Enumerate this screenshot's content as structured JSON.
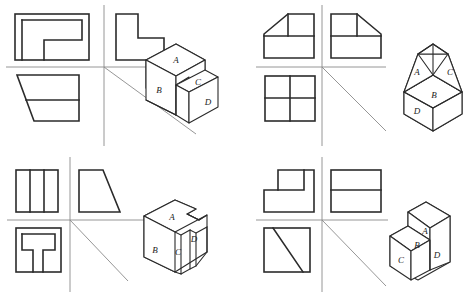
{
  "figure": {
    "kind": "engineering-drawing-worksheet",
    "panel_count": 4,
    "stroke_color": "#2b2b2b",
    "axis_color": "#8a8a8a",
    "background_color": "#ffffff"
  },
  "panels": [
    {
      "id": "panel-1",
      "position": "top-left",
      "views": [
        {
          "name": "top-view",
          "slot": "upper-left",
          "shape": "square-with-internal-L-partition",
          "outline": "square",
          "internal_lines": [
            "horizontal-mid-right",
            "vertical-mid-lower"
          ]
        },
        {
          "name": "front-view",
          "slot": "upper-right",
          "shape": "L-shaped-profile",
          "outline": "L-block"
        },
        {
          "name": "side-view",
          "slot": "lower-left",
          "shape": "trapezoid-with-horizontal-divider",
          "outline": "trapezoid",
          "internal_lines": [
            "horizontal-divider"
          ]
        }
      ],
      "axes": {
        "vertical": true,
        "horizontal": true,
        "diagonal_miter": true
      },
      "solid": {
        "name": "stepped-block",
        "description": "Two level stepped rectangular block seen in isometric",
        "labels": [
          "A",
          "B",
          "C",
          "D"
        ],
        "label_faces": {
          "A": "upper-top-face",
          "B": "front-left-vertical-face",
          "C": "lower-top-face",
          "D": "lower-right-vertical-face"
        }
      }
    },
    {
      "id": "panel-2",
      "position": "top-right",
      "views": [
        {
          "name": "top-view",
          "slot": "upper-left",
          "shape": "rectangle-with-left-chamfer",
          "outline": "rectangle-chamfered-top-left",
          "internal_lines": [
            "horizontal-mid",
            "vertical-upper"
          ]
        },
        {
          "name": "front-view",
          "slot": "upper-right",
          "shape": "rectangle-with-right-chamfer",
          "outline": "rectangle-chamfered-top-right",
          "internal_lines": [
            "horizontal-mid",
            "vertical-upper"
          ]
        },
        {
          "name": "side-view",
          "slot": "lower-left",
          "shape": "square-quartered",
          "outline": "square",
          "internal_lines": [
            "horizontal-mid",
            "vertical-mid"
          ]
        }
      ],
      "axes": {
        "vertical": true,
        "horizontal": true,
        "diagonal_miter": true
      },
      "solid": {
        "name": "hip-roof-on-base",
        "description": "Rectangular base block topped by a four sided hip roof",
        "labels": [
          "A",
          "B",
          "C",
          "D"
        ],
        "label_faces": {
          "A": "left-roof-slope",
          "B": "front-roof-slope",
          "C": "right-roof-slope",
          "D": "base-front-left-face"
        }
      }
    },
    {
      "id": "panel-3",
      "position": "bottom-left",
      "views": [
        {
          "name": "top-view",
          "slot": "upper-left",
          "shape": "square-with-two-vertical-dividers",
          "outline": "square",
          "internal_lines": [
            "vertical-third-1",
            "vertical-third-2"
          ]
        },
        {
          "name": "front-view",
          "slot": "upper-right",
          "shape": "right-trapezoid",
          "outline": "trapezoid-sloped-right"
        },
        {
          "name": "side-view",
          "slot": "lower-left",
          "shape": "square-with-inverted-T-notch",
          "outline": "square",
          "internal_lines": [
            "horizontal-mid",
            "vertical-left-leg",
            "vertical-right-leg"
          ]
        }
      ],
      "axes": {
        "vertical": true,
        "horizontal": true,
        "diagonal_miter": true
      },
      "solid": {
        "name": "grooved-wedge-block",
        "description": "Wedge shaped block with angled grooves and a notched top",
        "labels": [
          "A",
          "B",
          "C",
          "D"
        ],
        "label_faces": {
          "A": "top-face",
          "B": "left-vertical-face",
          "C": "first-angled-groove-face",
          "D": "second-angled-groove-face"
        }
      }
    },
    {
      "id": "panel-4",
      "position": "bottom-right",
      "views": [
        {
          "name": "top-view",
          "slot": "upper-left",
          "shape": "stepped-rectangle",
          "outline": "stepped-block",
          "internal_lines": [
            "step-riser"
          ]
        },
        {
          "name": "front-view",
          "slot": "upper-right",
          "shape": "rectangle-with-horizontal-divider",
          "outline": "rectangle",
          "internal_lines": [
            "horizontal-mid"
          ]
        },
        {
          "name": "side-view",
          "slot": "lower-left",
          "shape": "square-with-diagonal",
          "outline": "square",
          "internal_lines": [
            "diagonal"
          ]
        }
      ],
      "axes": {
        "vertical": true,
        "horizontal": true,
        "diagonal_miter": true
      },
      "solid": {
        "name": "two-step-block",
        "description": "Two tier stair shaped block seen in isometric",
        "labels": [
          "A",
          "B",
          "C",
          "D"
        ],
        "label_faces": {
          "A": "upper-top-face",
          "B": "step-riser-face",
          "C": "lower-front-left-face",
          "D": "lower-front-right-face"
        }
      }
    }
  ]
}
